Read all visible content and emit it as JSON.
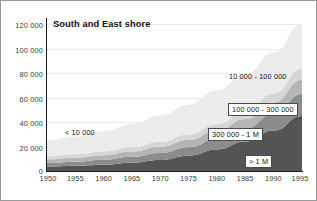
{
  "chart_data": {
    "type": "area",
    "stacked": true,
    "title": "South and East shore",
    "xlabel": "",
    "ylabel": "",
    "x": [
      1950,
      1955,
      1960,
      1965,
      1970,
      1975,
      1980,
      1985,
      1990,
      1995
    ],
    "xticks": [
      "1950",
      "1955",
      "1960",
      "1965",
      "1970",
      "1975",
      "1980",
      "1985",
      "1990",
      "1995"
    ],
    "yticks": [
      "0",
      "20 000",
      "40 000",
      "60 000",
      "80 000",
      "100 000",
      "120 000"
    ],
    "ytick_values": [
      0,
      20000,
      40000,
      60000,
      80000,
      100000,
      120000
    ],
    "xlim": [
      1950,
      1995
    ],
    "ylim": [
      0,
      125000
    ],
    "grid": true,
    "legend_position": "inline-annotations",
    "series": [
      {
        "name": "> 1 M",
        "label": "> 1 M",
        "color": "#545454",
        "values": [
          3500,
          4200,
          5200,
          6800,
          9000,
          12500,
          17500,
          24000,
          33000,
          45000
        ]
      },
      {
        "name": "300 000 - 1 M",
        "label": "300 000 - 1 M",
        "color": "#8c8c8c",
        "values": [
          3000,
          3400,
          4000,
          4800,
          5800,
          7000,
          8500,
          10500,
          13500,
          18000
        ]
      },
      {
        "name": "100 000 - 300 000",
        "label": "100 000 - 300 000",
        "color": "#b5b5b5",
        "values": [
          3000,
          3300,
          3700,
          4300,
          5000,
          5800,
          6800,
          8000,
          9500,
          11500
        ]
      },
      {
        "name": "unlabelled mid band",
        "label": "",
        "color": "#d6d6d6",
        "values": [
          2500,
          2800,
          3100,
          3500,
          4000,
          4600,
          5400,
          6300,
          7400,
          8800
        ]
      },
      {
        "name": "10 000 - 100 000",
        "label": "10 000 - 100 000",
        "color": "#ececec",
        "values": [
          13000,
          14500,
          16500,
          19000,
          21500,
          24500,
          27500,
          30500,
          33500,
          36500
        ]
      }
    ],
    "annotations": [
      {
        "text": "< 10 000",
        "boxed": false,
        "x_px": 64,
        "y_px": 128
      },
      {
        "text": "10 000 - 100 000",
        "boxed": false,
        "x_px": 228,
        "y_px": 72
      },
      {
        "text": "100 000 - 300 000",
        "boxed": true,
        "x_px": 227,
        "y_px": 102
      },
      {
        "text": "300 000 - 1 M",
        "boxed": true,
        "x_px": 207,
        "y_px": 127
      },
      {
        "text": "> 1 M",
        "boxed": true,
        "x_px": 244,
        "y_px": 154
      }
    ]
  }
}
